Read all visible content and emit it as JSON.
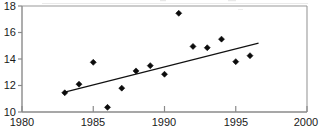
{
  "chart_data": {
    "type": "scatter",
    "title": "",
    "subtitle": "",
    "xlabel": "",
    "ylabel": "",
    "xlim": [
      1980,
      2000
    ],
    "ylim": [
      10,
      18
    ],
    "grid": false,
    "legend": null,
    "x_ticks": [
      1980,
      1985,
      1990,
      1995,
      2000
    ],
    "x_tick_labels": [
      "1980",
      "1985",
      "1990",
      "1995",
      "2000"
    ],
    "y_ticks": [
      10,
      12,
      14,
      16,
      18
    ],
    "y_tick_labels": [
      "10",
      "12",
      "14",
      "16",
      "18"
    ],
    "marker_style": "filled-diamond",
    "marker_color": "#0b0b0b",
    "x": [
      1983,
      1984,
      1985,
      1986,
      1987,
      1988,
      1989,
      1990,
      1991,
      1992,
      1993,
      1994,
      1995,
      1996
    ],
    "values": [
      11.45,
      12.1,
      13.75,
      10.35,
      11.8,
      13.1,
      13.5,
      12.85,
      17.45,
      14.95,
      14.85,
      15.5,
      13.8,
      14.25
    ],
    "series": [
      {
        "name": "observations",
        "type": "scatter",
        "x": [
          1983,
          1984,
          1985,
          1986,
          1987,
          1988,
          1989,
          1990,
          1991,
          1992,
          1993,
          1994,
          1995,
          1996
        ],
        "values": [
          11.45,
          12.1,
          13.75,
          10.35,
          11.8,
          13.1,
          13.5,
          12.85,
          17.45,
          14.95,
          14.85,
          15.5,
          13.8,
          14.25
        ]
      },
      {
        "name": "trend-line",
        "type": "line",
        "x": [
          1983.0,
          1996.6
        ],
        "values": [
          11.5,
          15.2
        ],
        "color": "#111111"
      }
    ],
    "annotations": []
  },
  "axes": {
    "x_axis_name": "year-axis",
    "y_axis_name": "value-axis"
  }
}
